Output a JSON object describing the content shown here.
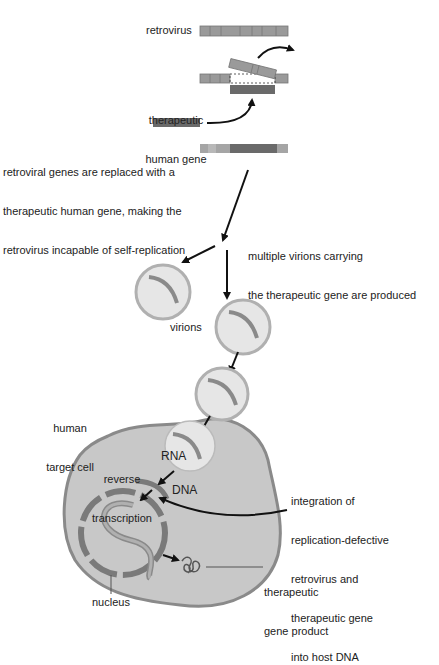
{
  "labels": {
    "retrovirus": "retrovirus",
    "therapeutic_gene_line1": "therapeutic",
    "therapeutic_gene_line2": "human gene",
    "replaced_line1": "retroviral genes are replaced with a",
    "replaced_line2": "therapeutic human gene, making the",
    "replaced_line3": "retrovirus incapable of self-replication",
    "multiple_line1": "multiple virions carrying",
    "multiple_line2": "the therapeutic gene are produced",
    "virions": "virions",
    "target_cell_line1": "human",
    "target_cell_line2": "target cell",
    "reverse_line1": "reverse",
    "reverse_line2": "transcription",
    "rna": "RNA",
    "dna": "DNA",
    "integration_line1": "integration of",
    "integration_line2": "replication-defective",
    "integration_line3": "retrovirus and",
    "integration_line4": "therapeutic gene",
    "integration_line5": "into host DNA",
    "product_line1": "therapeutic",
    "product_line2": "gene product",
    "nucleus": "nucleus"
  },
  "colors": {
    "viral_segment": "#9a9a9a",
    "therapeutic_gene": "#6a6a6a",
    "virion_fill": "#e6e6e6",
    "virion_border": "#b0b0b0",
    "cell_fill": "#c8c8c8",
    "cell_border": "#8a8a8a",
    "arrow": "#111111"
  }
}
